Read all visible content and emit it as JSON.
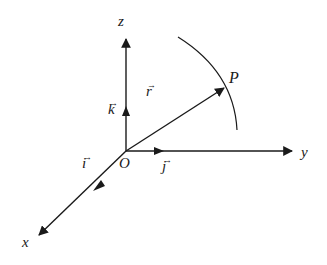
{
  "diagram": {
    "title": "",
    "colors": {
      "line": "#1a1a1a",
      "background": "#ffffff"
    },
    "origin": {
      "label": "O"
    },
    "axes": [
      {
        "name": "x",
        "label": "x"
      },
      {
        "name": "y",
        "label": "y"
      },
      {
        "name": "z",
        "label": "z"
      }
    ],
    "unit_vectors": [
      {
        "name": "i",
        "label": "i",
        "arrow": "→"
      },
      {
        "name": "j",
        "label": "j",
        "arrow": "→"
      },
      {
        "name": "k",
        "label": "k",
        "arrow": "→"
      }
    ],
    "position_vector": {
      "label": "r",
      "arrow": "→"
    },
    "point": {
      "label": "P"
    }
  }
}
